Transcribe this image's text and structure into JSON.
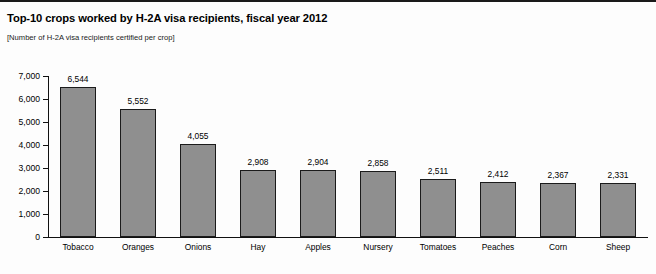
{
  "chart_data": {
    "type": "bar",
    "title": "Top-10 crops worked by H-2A visa recipients, fiscal year 2012",
    "subtitle": "[Number of H-2A visa recipients certified per crop]",
    "xlabel": "",
    "ylabel": "",
    "categories": [
      "Tobacco",
      "Oranges",
      "Onions",
      "Hay",
      "Apples",
      "Nursery",
      "Tomatoes",
      "Peaches",
      "Corn",
      "Sheep"
    ],
    "values": [
      6544,
      5552,
      4055,
      2908,
      2904,
      2858,
      2511,
      2412,
      2367,
      2331
    ],
    "value_labels": [
      "6,544",
      "5,552",
      "4,055",
      "2,908",
      "2,904",
      "2,858",
      "2,511",
      "2,412",
      "2,367",
      "2,331"
    ],
    "ylim": [
      0,
      7000
    ],
    "ytick_values": [
      0,
      1000,
      2000,
      3000,
      4000,
      5000,
      6000,
      7000
    ],
    "ytick_labels": [
      "0",
      "1,000",
      "2,000",
      "3,000",
      "4,000",
      "5,000",
      "6,000",
      "7,000"
    ],
    "grid": false,
    "legend": "none",
    "bar_color": "#8f8f8f",
    "bar_edge_color": "#1b1b1b",
    "axis_color": "#111111"
  }
}
